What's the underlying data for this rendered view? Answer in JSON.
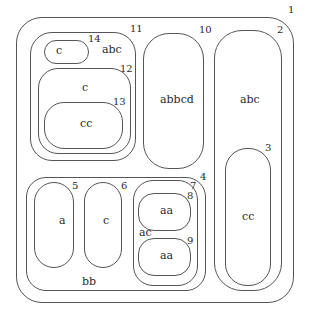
{
  "diagram": {
    "type": "nested-region-tree",
    "regions": [
      {
        "id": "1",
        "label": ""
      },
      {
        "id": "2",
        "label": "abc"
      },
      {
        "id": "3",
        "label": "cc"
      },
      {
        "id": "4",
        "label": "bb"
      },
      {
        "id": "5",
        "label": "a"
      },
      {
        "id": "6",
        "label": "c"
      },
      {
        "id": "7",
        "label": "ac"
      },
      {
        "id": "8",
        "label": "aa"
      },
      {
        "id": "9",
        "label": "aa"
      },
      {
        "id": "10",
        "label": "abbcd"
      },
      {
        "id": "11",
        "label": "abc"
      },
      {
        "id": "12",
        "label": "c"
      },
      {
        "id": "13",
        "label": "cc"
      },
      {
        "id": "14",
        "label": "c"
      }
    ],
    "nesting": {
      "1": [
        "2",
        "4",
        "10",
        "11"
      ],
      "2": [
        "3"
      ],
      "4": [
        "5",
        "6",
        "7"
      ],
      "7": [
        "8",
        "9"
      ],
      "11": [
        "12",
        "14"
      ],
      "12": [
        "13"
      ]
    }
  }
}
